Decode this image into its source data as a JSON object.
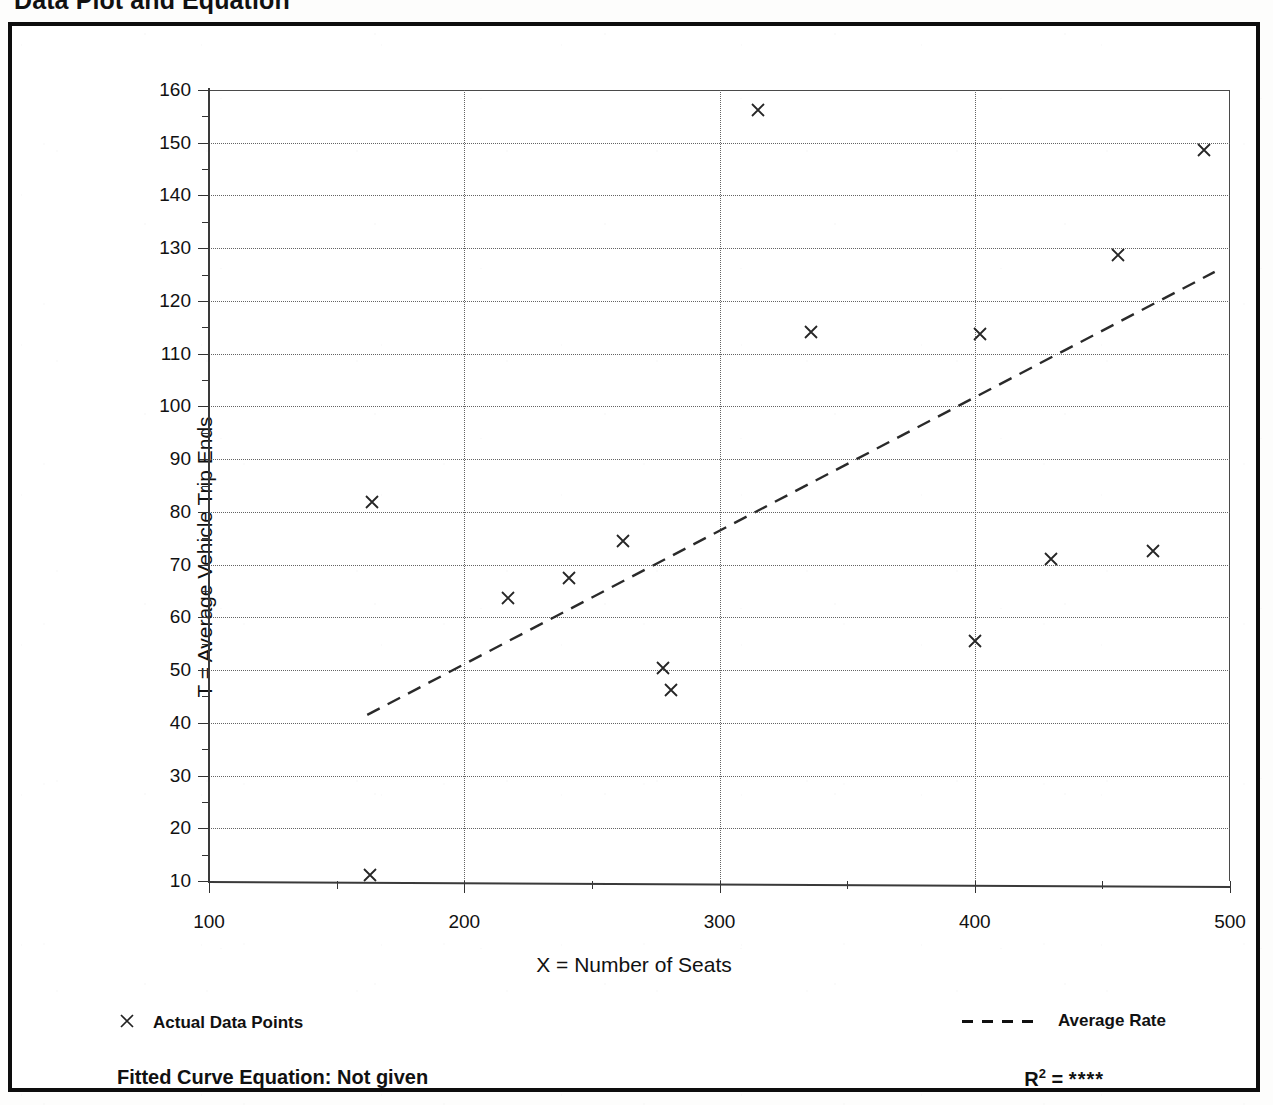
{
  "page": {
    "title": "Data Plot and Equation"
  },
  "chart_data": {
    "type": "scatter",
    "title": "Data Plot and Equation",
    "xlabel": "X = Number of Seats",
    "ylabel": "T = Average Vehicle Trip Ends",
    "xlim": [
      100,
      500
    ],
    "ylim": [
      10,
      160
    ],
    "xticks": [
      100,
      200,
      300,
      400,
      500
    ],
    "yticks": [
      10,
      20,
      30,
      40,
      50,
      60,
      70,
      80,
      90,
      100,
      110,
      120,
      130,
      140,
      150,
      160
    ],
    "x_minor_interval": 50,
    "y_minor_interval": 5,
    "grid": true,
    "legend_position": "below-plot",
    "series": [
      {
        "name": "Actual Data Points",
        "marker": "x",
        "points": [
          {
            "x": 163,
            "y": 11.2
          },
          {
            "x": 164,
            "y": 81.8
          },
          {
            "x": 217,
            "y": 63.6
          },
          {
            "x": 241,
            "y": 67.5
          },
          {
            "x": 262,
            "y": 74.4
          },
          {
            "x": 278,
            "y": 50.4
          },
          {
            "x": 281,
            "y": 46.2
          },
          {
            "x": 315,
            "y": 156.3
          },
          {
            "x": 336,
            "y": 114.2
          },
          {
            "x": 400,
            "y": 55.6
          },
          {
            "x": 402,
            "y": 113.8
          },
          {
            "x": 430,
            "y": 71.0
          },
          {
            "x": 456,
            "y": 128.8
          },
          {
            "x": 470,
            "y": 72.6
          },
          {
            "x": 490,
            "y": 148.7
          }
        ]
      },
      {
        "name": "Average Rate",
        "style": "dashed-line",
        "endpoints": [
          {
            "x": 162,
            "y": 41.5
          },
          {
            "x": 494,
            "y": 125.5
          }
        ]
      }
    ]
  },
  "legend": {
    "points_label": "Actual Data Points",
    "points_marker_icon": "x-marker-icon",
    "rate_label": "Average Rate",
    "rate_marker_icon": "dashed-line-icon"
  },
  "footer": {
    "fitted_equation": "Fitted Curve Equation:  Not given",
    "r_squared_symbol": "R",
    "r_squared_exponent": "2",
    "r_squared_equals": "=",
    "r_squared_value": "****"
  },
  "colors": {
    "ink": "#111111",
    "grid": "#5b5b5b",
    "frame": "#0d0d0d",
    "paper": "#fdfdfc"
  }
}
